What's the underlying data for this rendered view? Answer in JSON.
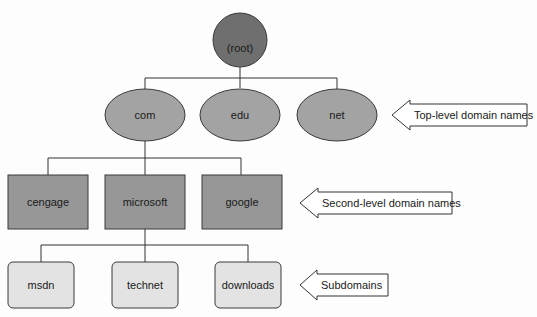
{
  "diagram": {
    "type": "tree",
    "colors": {
      "root_fill": "#6f6f6f",
      "tld_fill": "#a3a3a3",
      "sld_fill": "#979797",
      "sub_fill": "#e3e3e3",
      "stroke": "#3a3a3a",
      "line": "#333333"
    },
    "root": {
      "label": "(root)"
    },
    "top_level": [
      {
        "label": "com"
      },
      {
        "label": "edu"
      },
      {
        "label": "net"
      }
    ],
    "second_level": [
      {
        "label": "cengage"
      },
      {
        "label": "microsoft"
      },
      {
        "label": "google"
      }
    ],
    "subdomains": [
      {
        "label": "msdn"
      },
      {
        "label": "technet"
      },
      {
        "label": "downloads"
      }
    ],
    "callouts": [
      {
        "label": "Top-level domain names"
      },
      {
        "label": "Second-level domain names"
      },
      {
        "label": "Subdomains"
      }
    ],
    "edges": [
      [
        "(root)",
        "com"
      ],
      [
        "(root)",
        "edu"
      ],
      [
        "(root)",
        "net"
      ],
      [
        "com",
        "cengage"
      ],
      [
        "com",
        "microsoft"
      ],
      [
        "com",
        "google"
      ],
      [
        "microsoft",
        "msdn"
      ],
      [
        "microsoft",
        "technet"
      ],
      [
        "microsoft",
        "downloads"
      ]
    ]
  }
}
